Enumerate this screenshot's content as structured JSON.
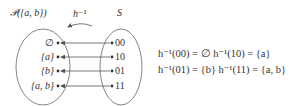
{
  "diagram": {
    "left_set": {
      "title": "𝒫({a, b})",
      "elements": [
        "∅",
        "{a}",
        "{b}",
        "{a, b}"
      ]
    },
    "right_set": {
      "title": "S",
      "elements": [
        "00",
        "10",
        "01",
        "11"
      ]
    },
    "mapping_label": "h⁻¹",
    "arrows": [
      {
        "from": "00",
        "to": "∅"
      },
      {
        "from": "10",
        "to": "{a}"
      },
      {
        "from": "01",
        "to": "{b}"
      },
      {
        "from": "11",
        "to": "{a, b}"
      }
    ],
    "equations": {
      "row1": "h⁻¹(00) = ∅   h⁻¹(10) = {a}",
      "row2": "h⁻¹(01) = {b}   h⁻¹(11) = {a, b}"
    },
    "stroke_color": "#555555"
  }
}
